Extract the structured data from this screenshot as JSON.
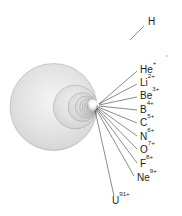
{
  "figure": {
    "background_color": "#ffffff",
    "sphere_fill": "#dcdcdc",
    "sphere_edge_color": "#9a9a9a",
    "highlight_color": "#ffffff",
    "leader_line_color": "#2a2a2a",
    "label_color": "#1d1d1d",
    "nucleus_point": {
      "x": 97,
      "y": 107
    }
  },
  "labels": [
    {
      "name": "H",
      "element": "H",
      "charge": "",
      "x": 148,
      "y": 22,
      "leader": {
        "x1": 144,
        "y1": 26,
        "x2": 130,
        "y2": 40
      }
    },
    {
      "name": "He+",
      "element": "He",
      "charge": "+",
      "x": 140,
      "y": 70,
      "leader": {
        "x1": 137,
        "y1": 71,
        "x2": 99,
        "y2": 104
      }
    },
    {
      "name": "Li2+",
      "element": "Li",
      "charge": "2+",
      "x": 140,
      "y": 83,
      "leader": {
        "x1": 137,
        "y1": 84,
        "x2": 99,
        "y2": 104
      }
    },
    {
      "name": "Be3+",
      "element": "Be",
      "charge": "3+",
      "x": 140,
      "y": 96,
      "leader": {
        "x1": 137,
        "y1": 97,
        "x2": 99,
        "y2": 105
      }
    },
    {
      "name": "B4+",
      "element": "B",
      "charge": "4+",
      "x": 140,
      "y": 110,
      "leader": {
        "x1": 137,
        "y1": 110,
        "x2": 99,
        "y2": 106
      }
    },
    {
      "name": "C5+",
      "element": "C",
      "charge": "5+",
      "x": 140,
      "y": 123,
      "leader": {
        "x1": 137,
        "y1": 123,
        "x2": 98,
        "y2": 107
      }
    },
    {
      "name": "N6+",
      "element": "N",
      "charge": "6+",
      "x": 140,
      "y": 137,
      "leader": {
        "x1": 137,
        "y1": 136,
        "x2": 98,
        "y2": 108
      }
    },
    {
      "name": "O7+",
      "element": "O",
      "charge": "7+",
      "x": 140,
      "y": 150,
      "leader": {
        "x1": 137,
        "y1": 149,
        "x2": 97,
        "y2": 108
      }
    },
    {
      "name": "F8+",
      "element": "F",
      "charge": "8+",
      "x": 140,
      "y": 164,
      "leader": {
        "x1": 137,
        "y1": 163,
        "x2": 97,
        "y2": 109
      }
    },
    {
      "name": "Ne9+",
      "element": "Ne",
      "charge": "9+",
      "x": 137,
      "y": 178,
      "leader": {
        "x1": 134,
        "y1": 176,
        "x2": 96,
        "y2": 109
      }
    },
    {
      "name": "U91+",
      "element": "U",
      "charge": "91+",
      "x": 112,
      "y": 201,
      "leader": {
        "x1": 114,
        "y1": 196,
        "x2": 95,
        "y2": 110
      }
    }
  ],
  "shells": [
    {
      "name": "H",
      "z": 1,
      "radius": 43.5
    },
    {
      "name": "He+",
      "z": 2,
      "radius": 21.8
    },
    {
      "name": "Li2+",
      "z": 3,
      "radius": 14.5
    },
    {
      "name": "Be3+",
      "z": 4,
      "radius": 10.9
    },
    {
      "name": "B4+",
      "z": 5,
      "radius": 8.7
    },
    {
      "name": "C5+",
      "z": 6,
      "radius": 7.3
    },
    {
      "name": "N6+",
      "z": 7,
      "radius": 6.2
    },
    {
      "name": "O7+",
      "z": 8,
      "radius": 5.4
    },
    {
      "name": "F8+",
      "z": 9,
      "radius": 4.8
    },
    {
      "name": "Ne9+",
      "z": 10,
      "radius": 4.4
    },
    {
      "name": "U91+",
      "z": 92,
      "radius": 1.6
    }
  ]
}
